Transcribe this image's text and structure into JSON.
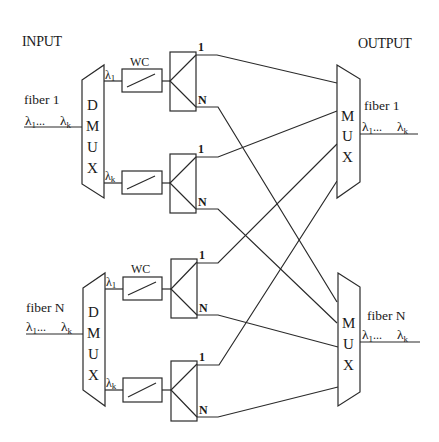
{
  "diagram": {
    "input_label": "INPUT",
    "output_label": "OUTPUT",
    "lambda": "λ",
    "lambda_sub_1": "1",
    "lambda_sub_k": "k",
    "ellipsis": "...",
    "inputs": [
      {
        "fiber_label": "fiber 1",
        "demux_letters": [
          "D",
          "M",
          "U",
          "X"
        ],
        "wc_label": "WC",
        "ch_top": "λ1",
        "ch_bottom": "λk"
      },
      {
        "fiber_label": "fiber N",
        "demux_letters": [
          "D",
          "M",
          "U",
          "X"
        ],
        "wc_label": "WC",
        "ch_top": "λ1",
        "ch_bottom": "λk"
      }
    ],
    "outputs": [
      {
        "fiber_label": "fiber 1",
        "mux_letters": [
          "M",
          "U",
          "X"
        ]
      },
      {
        "fiber_label": "fiber N",
        "mux_letters": [
          "M",
          "U",
          "X"
        ]
      }
    ],
    "splitter_ports": {
      "first": "1",
      "last": "N"
    },
    "connections": [
      {
        "from": "splitter-1 port 1",
        "to": "mux-1"
      },
      {
        "from": "splitter-1 port N",
        "to": "mux-N"
      },
      {
        "from": "splitter-2 port 1",
        "to": "mux-1"
      },
      {
        "from": "splitter-2 port N",
        "to": "mux-N"
      },
      {
        "from": "splitter-3 port 1",
        "to": "mux-1"
      },
      {
        "from": "splitter-3 port N",
        "to": "mux-N"
      },
      {
        "from": "splitter-4 port 1",
        "to": "mux-1"
      },
      {
        "from": "splitter-4 port N",
        "to": "mux-N"
      }
    ],
    "colors": {
      "line": "#2a2a2a",
      "text": "#1a1a1a",
      "background": "#ffffff"
    }
  }
}
